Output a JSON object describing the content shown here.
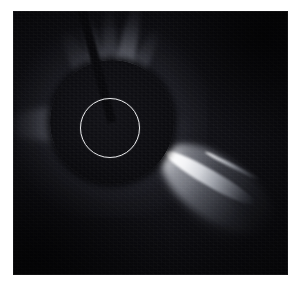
{
  "image": {
    "title": "SOHO LASCO C2 coronagraph frame",
    "subject": "sungrazing comet near the Sun",
    "background_color": "#070709",
    "page_background_color": "#ffffff",
    "frame": {
      "left": 13,
      "top": 11,
      "width": 275,
      "height": 264
    }
  },
  "occulting_disk": {
    "label": "occulting-disk",
    "center_x": 99,
    "center_y": 111,
    "radius": 62,
    "color": "#0a0a0e"
  },
  "sun_circle": {
    "label": "sun-outline-circle",
    "center_x": 97,
    "center_y": 117,
    "radius": 30,
    "stroke_color": "#e9eaec",
    "stroke_width": 1.4
  },
  "pylon": {
    "label": "occulter-support-pylon",
    "angle_deg": 255,
    "length": 120,
    "thickness": 9,
    "color": "#08080b"
  },
  "streamers": [
    {
      "name": "streamer-upper-left-far",
      "angle_deg": -118,
      "length": 105,
      "thickness": 20,
      "brightness": 0.45
    },
    {
      "name": "streamer-upper-left",
      "angle_deg": -104,
      "length": 112,
      "thickness": 17,
      "brightness": 0.55
    },
    {
      "name": "streamer-north",
      "angle_deg": -92,
      "length": 118,
      "thickness": 15,
      "brightness": 0.6
    },
    {
      "name": "streamer-north-bright",
      "angle_deg": -78,
      "length": 122,
      "thickness": 18,
      "brightness": 0.95
    },
    {
      "name": "streamer-upper-right",
      "angle_deg": -64,
      "length": 104,
      "thickness": 16,
      "brightness": 0.62
    },
    {
      "name": "streamer-west-left",
      "angle_deg": 178,
      "length": 108,
      "thickness": 34,
      "brightness": 0.7
    },
    {
      "name": "streamer-lower-left",
      "angle_deg": 160,
      "length": 74,
      "thickness": 22,
      "brightness": 0.3
    },
    {
      "name": "streamer-east-faint",
      "angle_deg": 6,
      "length": 86,
      "thickness": 24,
      "brightness": 0.22
    }
  ],
  "comet": {
    "name": "sungrazing-comet",
    "nucleus_x": 152,
    "nucleus_y": 141,
    "tail_angle_deg": 33,
    "tail_length": 132,
    "fan": {
      "angle_deg": 35,
      "length": 128,
      "thickness": 62,
      "brightness": 0.8
    },
    "core": {
      "angle_deg": 30,
      "length": 104,
      "thickness": 16,
      "brightness": 1.0
    },
    "streak": {
      "start_x": 192,
      "start_y": 141,
      "angle_deg": 27,
      "length": 62,
      "thickness": 4,
      "brightness": 1.0
    }
  },
  "colors": {
    "brightest": "#ffffff",
    "corona_glow": "#c8ccd8",
    "deep_space": "#060608",
    "margin": "#ffffff"
  }
}
